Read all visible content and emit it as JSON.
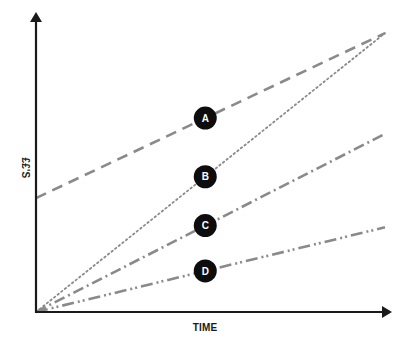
{
  "chart_data": {
    "type": "line",
    "title": "",
    "xlabel": "TIME",
    "ylabel": "££'S",
    "xlim": [
      0,
      1
    ],
    "ylim": [
      0,
      1
    ],
    "grid": false,
    "ticks": false,
    "axis_color": "#1a1a1a",
    "line_color": "#8a8a8a",
    "marker_color": "#0d0d0d",
    "marker_text_color": "#ffffff",
    "series": [
      {
        "name": "A",
        "style": "dashed",
        "x": [
          0,
          1
        ],
        "y": [
          0.39,
          0.955
        ],
        "label_x": 0.485
      },
      {
        "name": "B",
        "style": "dotted",
        "x": [
          0,
          1
        ],
        "y": [
          0.0,
          0.955
        ],
        "label_x": 0.485
      },
      {
        "name": "C",
        "style": "dash-dot",
        "x": [
          0,
          1
        ],
        "y": [
          0.0,
          0.61
        ],
        "label_x": 0.485
      },
      {
        "name": "D",
        "style": "dash-dot-dot",
        "x": [
          0,
          1
        ],
        "y": [
          0.0,
          0.29
        ],
        "label_x": 0.485
      }
    ]
  }
}
